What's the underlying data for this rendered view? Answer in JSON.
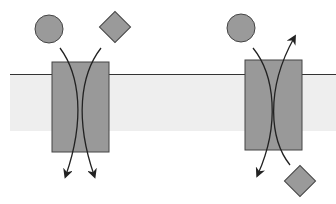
{
  "diagram": {
    "title": "",
    "colors": {
      "background": "#ffffff",
      "membrane": "#eeeeee",
      "membrane_line": "#333333",
      "transporter": "#999999",
      "molecule": "#9a9a9a",
      "stroke": "#333333"
    },
    "transporters": [
      {
        "name": "symporter",
        "description": "circle and diamond both move downward through the same transporter"
      },
      {
        "name": "antiporter",
        "description": "circle moves downward while diamond moves upward"
      }
    ],
    "molecules": [
      {
        "shape": "circle"
      },
      {
        "shape": "diamond"
      }
    ]
  }
}
